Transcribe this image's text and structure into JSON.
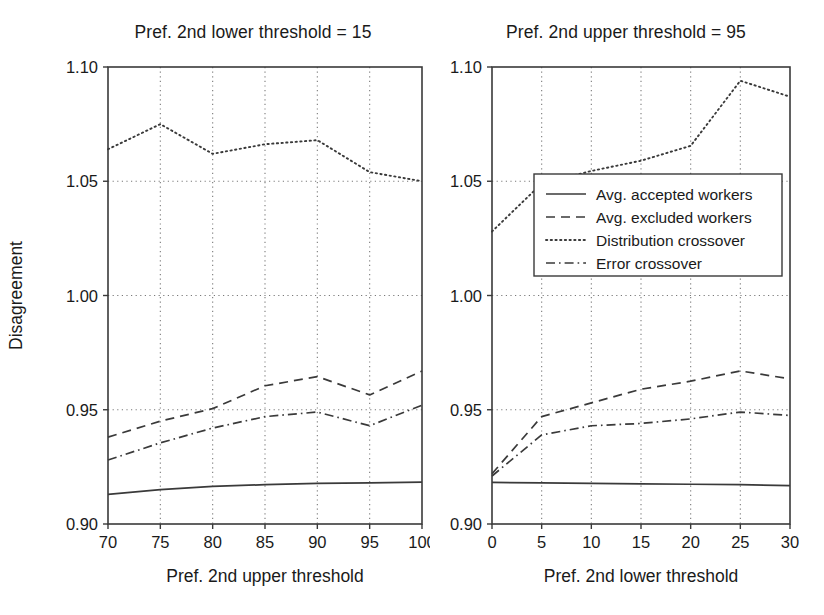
{
  "figure": {
    "width": 824,
    "height": 615,
    "background": "#ffffff",
    "ink_color": "#3a3a3a"
  },
  "legend": {
    "position": "center-right of right panel",
    "entries": [
      {
        "label": "Avg. accepted workers",
        "style": "solid"
      },
      {
        "label": "Avg. excluded workers",
        "style": "dashed"
      },
      {
        "label": "Distribution crossover",
        "style": "dotted"
      },
      {
        "label": "Error crossover",
        "style": "dashdot"
      }
    ]
  },
  "chart_data": [
    {
      "type": "line",
      "panel": "left",
      "title": "Pref. 2nd lower threshold = 15",
      "xlabel": "Pref. 2nd upper threshold",
      "ylabel": "Disagreement",
      "x": [
        70,
        75,
        80,
        85,
        90,
        95,
        100
      ],
      "xlim": [
        70,
        100
      ],
      "ylim": [
        0.9,
        1.1
      ],
      "xticks": [
        70,
        75,
        80,
        85,
        90,
        95,
        100
      ],
      "yticks": [
        0.9,
        0.95,
        1.0,
        1.05,
        1.1
      ],
      "xtick_labels": [
        "70",
        "75",
        "80",
        "85",
        "90",
        "95",
        "100"
      ],
      "ytick_labels": [
        "0.90",
        "0.95",
        "1.00",
        "1.05",
        "1.10"
      ],
      "grid": true,
      "series": [
        {
          "name": "Avg. accepted workers",
          "style": "solid",
          "values": [
            0.913,
            0.915,
            0.9165,
            0.9172,
            0.9178,
            0.918,
            0.9183
          ]
        },
        {
          "name": "Avg. excluded workers",
          "style": "dashed",
          "values": [
            0.938,
            0.945,
            0.9505,
            0.9605,
            0.9645,
            0.9565,
            0.967
          ]
        },
        {
          "name": "Distribution crossover",
          "style": "dotted",
          "values": [
            1.064,
            1.075,
            1.062,
            1.0662,
            1.068,
            1.054,
            1.05
          ]
        },
        {
          "name": "Error crossover",
          "style": "dashdot",
          "values": [
            0.928,
            0.9355,
            0.942,
            0.947,
            0.949,
            0.943,
            0.952
          ]
        }
      ]
    },
    {
      "type": "line",
      "panel": "right",
      "title": "Pref. 2nd upper threshold = 95",
      "xlabel": "Pref. 2nd lower threshold",
      "ylabel": "Disagreement",
      "x": [
        0,
        5,
        10,
        15,
        20,
        25,
        30
      ],
      "xlim": [
        0,
        30
      ],
      "ylim": [
        0.9,
        1.1
      ],
      "xticks": [
        0,
        5,
        10,
        15,
        20,
        25,
        30
      ],
      "yticks": [
        0.9,
        0.95,
        1.0,
        1.05,
        1.1
      ],
      "xtick_labels": [
        "0",
        "5",
        "10",
        "15",
        "20",
        "25",
        "30"
      ],
      "ytick_labels": [
        "0.90",
        "0.95",
        "1.00",
        "1.05",
        "1.10"
      ],
      "grid": true,
      "series": [
        {
          "name": "Avg. accepted workers",
          "style": "solid",
          "values": [
            0.9182,
            0.918,
            0.9178,
            0.9176,
            0.9174,
            0.9172,
            0.9168
          ]
        },
        {
          "name": "Avg. excluded workers",
          "style": "dashed",
          "values": [
            0.922,
            0.947,
            0.953,
            0.959,
            0.9625,
            0.967,
            0.9635
          ]
        },
        {
          "name": "Distribution crossover",
          "style": "dotted",
          "values": [
            1.028,
            1.049,
            1.0545,
            1.059,
            1.0655,
            1.094,
            1.087
          ]
        },
        {
          "name": "Error crossover",
          "style": "dashdot",
          "values": [
            0.921,
            0.939,
            0.943,
            0.944,
            0.946,
            0.949,
            0.9475
          ]
        }
      ]
    }
  ]
}
